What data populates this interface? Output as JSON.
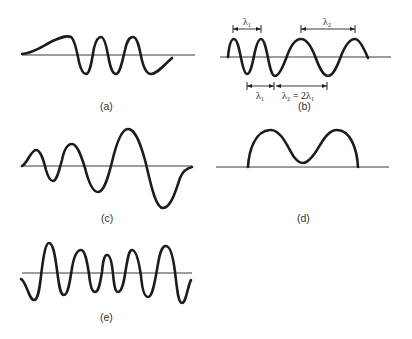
{
  "figure": {
    "panels": [
      {
        "id": "a",
        "label": "(a)",
        "shape": "wave packet rising from left with three oscillations, decaying at right"
      },
      {
        "id": "b",
        "label": "(b)",
        "shape": "two short-wavelength cycles followed by longer-wavelength cycles",
        "annotations": {
          "top_left": "λ₁",
          "top_right": "λ₂",
          "bottom_left": "λ₁",
          "bottom_right": "λ₂ = 2λ₁"
        }
      },
      {
        "id": "c",
        "label": "(c)",
        "shape": "oscillation with increasing amplitude and wavelength"
      },
      {
        "id": "d",
        "label": "(d)",
        "shape": "double-hump pulse above the axis"
      },
      {
        "id": "e",
        "label": "(e)",
        "shape": "oscillation with amplitude modulation, smaller in the middle"
      }
    ]
  },
  "colors": {
    "stroke": "#1c1c1c",
    "axis": "#3a3a3a",
    "background": "#ffffff"
  }
}
